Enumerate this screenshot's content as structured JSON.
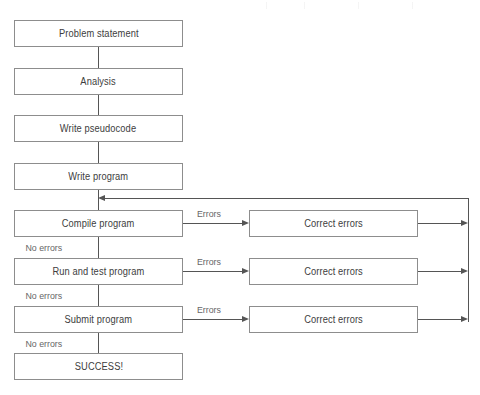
{
  "diagram": {
    "background_color": "#ffffff",
    "box_border_color": "#8d8d8d",
    "line_color": "#555555",
    "text_color": "#3d3d3d",
    "label_color": "#666666"
  },
  "nodes": {
    "problem_statement": "Problem statement",
    "analysis": "Analysis",
    "write_pseudocode": "Write pseudocode",
    "write_program": "Write program",
    "compile_program": "Compile program",
    "run_and_test_program": "Run and test program",
    "submit_program": "Submit program",
    "success": "SUCCESS!",
    "correct_errors_compile": "Correct errors",
    "correct_errors_test": "Correct errors",
    "correct_errors_submit": "Correct errors"
  },
  "edge_labels": {
    "errors_compile": "Errors",
    "errors_test": "Errors",
    "errors_submit": "Errors",
    "no_errors_compile": "No errors",
    "no_errors_test": "No errors",
    "no_errors_submit": "No errors"
  }
}
